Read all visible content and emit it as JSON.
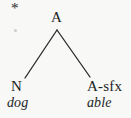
{
  "figure": {
    "type": "syntax-tree",
    "background_color": "#f8f8f6",
    "ink_color": "#211f1d",
    "width": 131,
    "height": 118
  },
  "markers": {
    "ungrammatical": "*"
  },
  "tree": {
    "root": {
      "label": "A",
      "x": 57,
      "y": 18
    },
    "branches": [
      {
        "name": "left-branch",
        "x1": 57,
        "y1": 30,
        "x2": 25,
        "y2": 78
      },
      {
        "name": "right-branch",
        "x1": 57,
        "y1": 30,
        "x2": 90,
        "y2": 77
      }
    ],
    "children": [
      {
        "category": "N",
        "terminal": "dog",
        "x": 19,
        "y": 86
      },
      {
        "category": "A-sfx",
        "terminal": "able",
        "x": 106,
        "y": 86
      }
    ]
  },
  "line_style": {
    "color": "#2a2724",
    "width": 1.3
  }
}
